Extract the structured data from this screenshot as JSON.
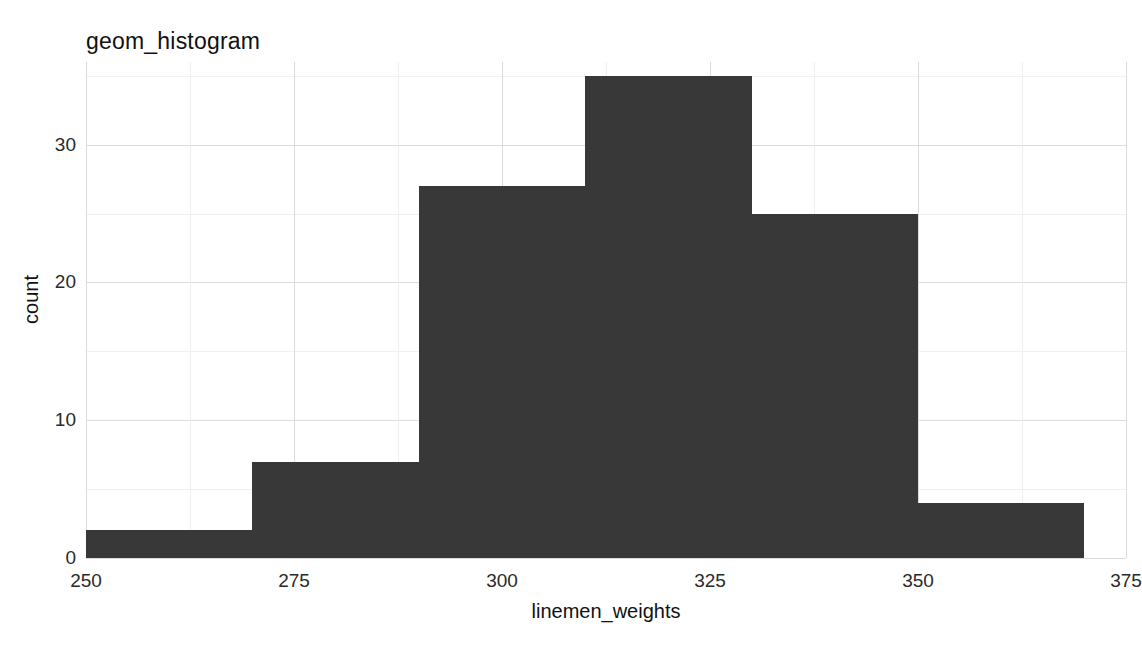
{
  "chart_data": {
    "type": "bar",
    "title": "geom_histogram",
    "xlabel": "linemen_weights",
    "ylabel": "count",
    "xlim": [
      250,
      375
    ],
    "ylim": [
      0,
      36
    ],
    "grid": true,
    "legend": "none",
    "bin_width": 20,
    "bin_edges": [
      250,
      270,
      290,
      310,
      330,
      350,
      370
    ],
    "categories": [
      "250-270",
      "270-290",
      "290-310",
      "310-330",
      "330-350",
      "350-370"
    ],
    "values": [
      2,
      7,
      27,
      35,
      25,
      4
    ],
    "bar_color": "#383838",
    "x_ticks": [
      250,
      275,
      300,
      325,
      350,
      375
    ],
    "x_tick_labels": [
      "250",
      "275",
      "300",
      "325",
      "350",
      "375"
    ],
    "y_ticks": [
      0,
      10,
      20,
      30
    ],
    "y_tick_labels": [
      "0",
      "10",
      "20",
      "30"
    ],
    "x_minor_ticks": [
      262.5,
      287.5,
      312.5,
      337.5,
      362.5
    ],
    "y_minor_ticks": [
      5,
      15,
      25,
      35
    ],
    "panel_background": "#ffffff",
    "gridline_major_color": "#dcdcdc",
    "gridline_minor_color": "#f0f0f0"
  }
}
